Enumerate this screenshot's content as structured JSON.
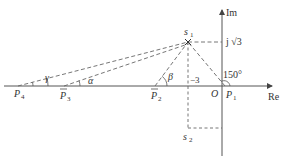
{
  "diagram": {
    "type": "s-plane root locus angle construction",
    "axes": {
      "real_label": "Re",
      "imag_label": "Im",
      "origin_label": "O"
    },
    "points": {
      "s1": {
        "label": "s",
        "sub": "1"
      },
      "s2": {
        "label": "s",
        "sub": "2"
      },
      "p1": {
        "label": "P",
        "sub": "1"
      },
      "p2": {
        "label": "P",
        "sub": "2"
      },
      "p3": {
        "label": "P",
        "sub": "3"
      },
      "p4": {
        "label": "P",
        "sub": "4"
      }
    },
    "annotations": {
      "imag_value": "j √3",
      "real_value": "−3",
      "angle_p1": "150°",
      "angle_alpha": "α",
      "angle_beta": "β",
      "angle_gamma": "γ"
    },
    "colors": {
      "line": "#555555",
      "text": "#333333",
      "background": "#ffffff"
    }
  }
}
